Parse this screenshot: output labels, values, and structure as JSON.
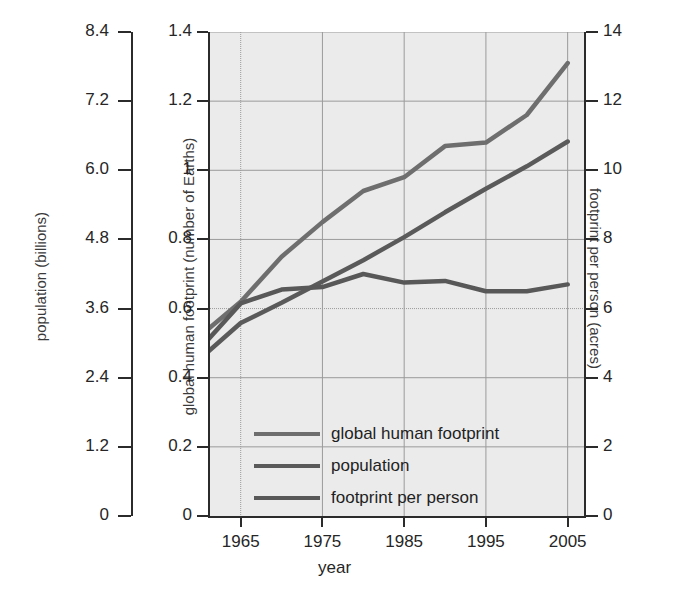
{
  "chart_data": {
    "type": "line",
    "title": "",
    "xlabel": "year",
    "x_ticks": [
      1965,
      1975,
      1985,
      1995,
      2005
    ],
    "xlim": [
      1961,
      2007
    ],
    "grid": true,
    "legend_position": "inside-bottom-left",
    "axes": [
      {
        "id": "population",
        "side": "left-outer",
        "label": "population (billions)",
        "ticks": [
          "0",
          "1.2",
          "2.4",
          "3.6",
          "4.8",
          "6.0",
          "7.2",
          "8.4"
        ],
        "lim": [
          0,
          8.4
        ]
      },
      {
        "id": "footprint",
        "side": "left-inner",
        "label": "global human footprint (number of Earths)",
        "ticks": [
          "0",
          "0.2",
          "0.4",
          "0.6",
          "0.8",
          "1",
          "1.2",
          "1.4"
        ],
        "lim": [
          0,
          1.4
        ]
      },
      {
        "id": "per_person",
        "side": "right",
        "label": "footprint per person (acres)",
        "ticks": [
          "0",
          "2",
          "4",
          "6",
          "8",
          "10",
          "12",
          "14"
        ],
        "lim": [
          0,
          14
        ]
      }
    ],
    "series": [
      {
        "name": "global human footprint",
        "axis": "footprint",
        "unit": "number of Earths",
        "color": "#6e6e6e",
        "x": [
          1961,
          1965,
          1970,
          1975,
          1980,
          1985,
          1990,
          1995,
          2000,
          2005
        ],
        "values": [
          0.54,
          0.62,
          0.75,
          0.85,
          0.94,
          0.98,
          1.07,
          1.08,
          1.16,
          1.31
        ]
      },
      {
        "name": "population",
        "axis": "population",
        "unit": "billions",
        "color": "#5a5a5a",
        "x": [
          1961,
          1965,
          1970,
          1975,
          1980,
          1985,
          1990,
          1995,
          2000,
          2005
        ],
        "values": [
          2.85,
          3.35,
          3.7,
          4.07,
          4.44,
          4.84,
          5.27,
          5.68,
          6.07,
          6.5
        ]
      },
      {
        "name": "footprint per person",
        "axis": "per_person",
        "unit": "acres",
        "color": "#585858",
        "x": [
          1961,
          1965,
          1970,
          1975,
          1980,
          1985,
          1990,
          1995,
          2000,
          2005
        ],
        "values": [
          5.1,
          6.15,
          6.55,
          6.62,
          7.0,
          6.75,
          6.8,
          6.5,
          6.5,
          6.7
        ]
      }
    ]
  },
  "legend": {
    "items": [
      {
        "label": "global human footprint",
        "color": "#6e6e6e"
      },
      {
        "label": "population",
        "color": "#5a5a5a"
      },
      {
        "label": "footprint per person",
        "color": "#585858"
      }
    ]
  }
}
